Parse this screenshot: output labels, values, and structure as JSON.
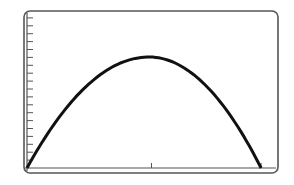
{
  "chart_data": {
    "type": "line",
    "title": "",
    "xlabel": "",
    "ylabel": "",
    "grid": false,
    "legend": null,
    "xlim": [
      0,
      1
    ],
    "ylim": [
      0,
      1
    ],
    "x_ticks": [
      0.5,
      0.94
    ],
    "y_tick_count": 19,
    "series": [
      {
        "name": "curve",
        "shape": "parabola",
        "x": [
          0.0,
          0.1,
          0.2,
          0.3,
          0.4,
          0.49,
          0.6,
          0.7,
          0.8,
          0.9,
          0.94
        ],
        "y": [
          0.0,
          0.27,
          0.48,
          0.63,
          0.72,
          0.74,
          0.71,
          0.6,
          0.42,
          0.16,
          0.0
        ]
      }
    ],
    "colors": {
      "frame": "#555555",
      "curve": "#111111",
      "background": "#ffffff"
    }
  }
}
